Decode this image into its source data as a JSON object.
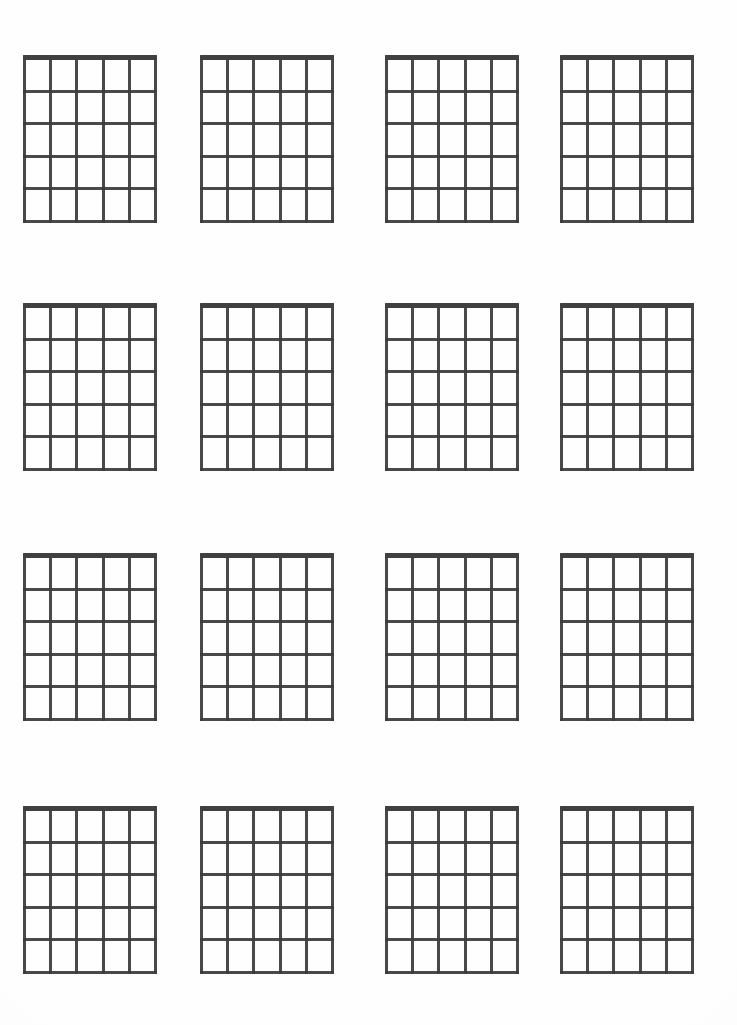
{
  "document": {
    "title": "Blank Guitar Chord Chart Sheet",
    "page_background_color": "#fefefe",
    "ink_color": "#3c3b3a",
    "nut_color": "#333231"
  },
  "sheet": {
    "layout": {
      "columns": 4,
      "rows": 4,
      "total_diagrams": 16,
      "column_x": [
        23,
        200,
        385,
        560
      ],
      "row_y": [
        55,
        303,
        553,
        806
      ],
      "diagram_width": 134,
      "diagram_height": 168
    },
    "diagram_spec": {
      "strings": 6,
      "frets": 5,
      "has_nut": true,
      "nut_thickness": 5,
      "line_thickness": 3,
      "label": "blank chord diagram",
      "fingerings": []
    },
    "diagrams": [
      {
        "index": 1,
        "name": "chord-diagram-1",
        "row": 1,
        "column": 1
      },
      {
        "index": 2,
        "name": "chord-diagram-2",
        "row": 1,
        "column": 2
      },
      {
        "index": 3,
        "name": "chord-diagram-3",
        "row": 1,
        "column": 3
      },
      {
        "index": 4,
        "name": "chord-diagram-4",
        "row": 1,
        "column": 4
      },
      {
        "index": 5,
        "name": "chord-diagram-5",
        "row": 2,
        "column": 1
      },
      {
        "index": 6,
        "name": "chord-diagram-6",
        "row": 2,
        "column": 2
      },
      {
        "index": 7,
        "name": "chord-diagram-7",
        "row": 2,
        "column": 3
      },
      {
        "index": 8,
        "name": "chord-diagram-8",
        "row": 2,
        "column": 4
      },
      {
        "index": 9,
        "name": "chord-diagram-9",
        "row": 3,
        "column": 1
      },
      {
        "index": 10,
        "name": "chord-diagram-10",
        "row": 3,
        "column": 2
      },
      {
        "index": 11,
        "name": "chord-diagram-11",
        "row": 3,
        "column": 3
      },
      {
        "index": 12,
        "name": "chord-diagram-12",
        "row": 3,
        "column": 4
      },
      {
        "index": 13,
        "name": "chord-diagram-13",
        "row": 4,
        "column": 1
      },
      {
        "index": 14,
        "name": "chord-diagram-14",
        "row": 4,
        "column": 2
      },
      {
        "index": 15,
        "name": "chord-diagram-15",
        "row": 4,
        "column": 3
      },
      {
        "index": 16,
        "name": "chord-diagram-16",
        "row": 4,
        "column": 4
      }
    ]
  }
}
